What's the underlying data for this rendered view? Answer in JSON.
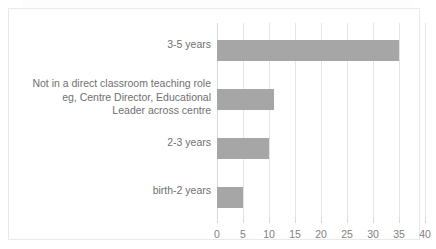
{
  "chart_data": {
    "type": "bar",
    "orientation": "horizontal",
    "title": "",
    "subtitle": "",
    "xlabel": "",
    "ylabel": "",
    "categories": [
      "3-5 years",
      "Not in a direct classroom teaching role eg, Centre Director, Educational Leader across centre",
      "2-3 years",
      "birth-2 years"
    ],
    "values": [
      35,
      11,
      10,
      5
    ],
    "xlim": [
      0,
      40
    ],
    "xticks": [
      0,
      5,
      10,
      15,
      20,
      25,
      30,
      35,
      40
    ],
    "xtick_labels": [
      "0",
      "5",
      "10",
      "15",
      "20",
      "25",
      "30",
      "35",
      "40"
    ],
    "grid": true,
    "grid_axis": "x",
    "legend": false,
    "legend_position": "none",
    "series": [
      {
        "name": "",
        "values": [
          35,
          11,
          10,
          5
        ]
      }
    ]
  },
  "style": {
    "bar_color": "#a6a6a6",
    "gridline_color": "#e4e4e4",
    "axis_color": "#d9d9d9",
    "border_color": "#e9e9e9",
    "label_color": "#6f6f6f",
    "tick_label_color": "#808080",
    "background": "#ffffff"
  }
}
